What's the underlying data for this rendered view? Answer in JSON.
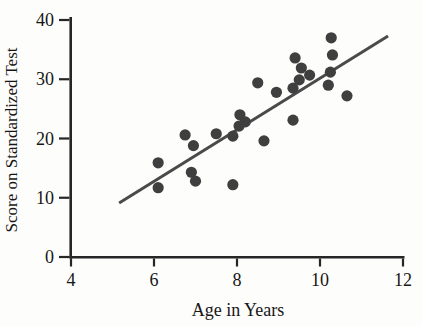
{
  "figure": {
    "type": "scatter-plot-figure"
  },
  "chart_data": {
    "type": "scatter",
    "title": "",
    "xlabel": "Age in Years",
    "ylabel": "Score on Standardized Test",
    "xlim": [
      4,
      12
    ],
    "ylim": [
      0,
      40
    ],
    "xticks": [
      4,
      6,
      8,
      10,
      12
    ],
    "yticks": [
      0,
      10,
      20,
      30,
      40
    ],
    "grid": false,
    "legend": "none",
    "points": [
      [
        6.1,
        15.9
      ],
      [
        6.1,
        11.7
      ],
      [
        6.75,
        20.6
      ],
      [
        6.95,
        18.8
      ],
      [
        6.9,
        14.3
      ],
      [
        7.0,
        12.8
      ],
      [
        7.5,
        20.8
      ],
      [
        7.9,
        20.4
      ],
      [
        7.9,
        12.2
      ],
      [
        8.05,
        22.1
      ],
      [
        8.07,
        24.0
      ],
      [
        8.2,
        22.8
      ],
      [
        8.5,
        29.4
      ],
      [
        8.65,
        19.6
      ],
      [
        8.95,
        27.8
      ],
      [
        9.35,
        28.5
      ],
      [
        9.35,
        23.1
      ],
      [
        9.4,
        33.6
      ],
      [
        9.5,
        29.9
      ],
      [
        9.55,
        31.9
      ],
      [
        9.75,
        30.7
      ],
      [
        10.2,
        29.0
      ],
      [
        10.25,
        31.2
      ],
      [
        10.27,
        37.0
      ],
      [
        10.3,
        34.1
      ],
      [
        10.65,
        27.2
      ]
    ],
    "trend_line": {
      "x1": 5.16,
      "y1": 9.1,
      "x2": 11.64,
      "y2": 37.3
    },
    "colors": {
      "point": "#3f3f3f",
      "trend_line": "#4a4a4a",
      "axis": "#262626",
      "text": "#161616",
      "background": "#fdfdfc"
    }
  }
}
